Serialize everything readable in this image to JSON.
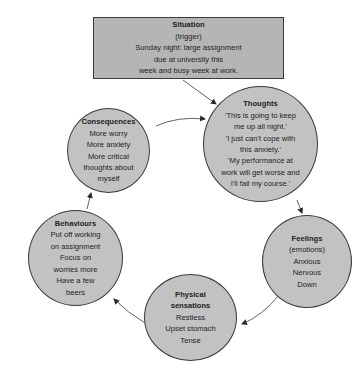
{
  "diagram": {
    "type": "cycle",
    "colors": {
      "box_fill": "#b5b5b5",
      "circle_fill": "#c2c2c2",
      "stroke": "#3a3a3a"
    },
    "situation": {
      "title": "Situation",
      "lines": [
        "(trigger)",
        "Sunday night: large assignment",
        "due at university this",
        "week and busy week at work."
      ]
    },
    "thoughts": {
      "title": "Thoughts",
      "lines": [
        "'This is going to keep",
        "me up all night.'",
        "'I just can't cope with",
        "this anxiety.'",
        "'My performance at",
        "work will get worse and",
        "I'll fail my course.'"
      ]
    },
    "feelings": {
      "title": "Feelings",
      "lines": [
        "(emotions)",
        "Anxious",
        "Nervous",
        "Down"
      ]
    },
    "physical": {
      "title_lines": [
        "Physical",
        "sensations"
      ],
      "lines": [
        "Restless",
        "Upset stomach",
        "Tense"
      ]
    },
    "behaviours": {
      "title": "Behaviours",
      "lines": [
        "Put off working",
        "on assignment",
        "Focus on",
        "worries more",
        "Have a few",
        "beers"
      ]
    },
    "consequences": {
      "title": "Consequences",
      "lines": [
        "More worry",
        "More anxiety",
        "More critical",
        "thoughts about",
        "myself"
      ]
    },
    "edges": [
      {
        "from": "situation",
        "to": "thoughts"
      },
      {
        "from": "consequences",
        "to": "thoughts"
      },
      {
        "from": "thoughts",
        "to": "feelings"
      },
      {
        "from": "feelings",
        "to": "physical"
      },
      {
        "from": "physical",
        "to": "behaviours"
      },
      {
        "from": "behaviours",
        "to": "consequences"
      }
    ]
  }
}
